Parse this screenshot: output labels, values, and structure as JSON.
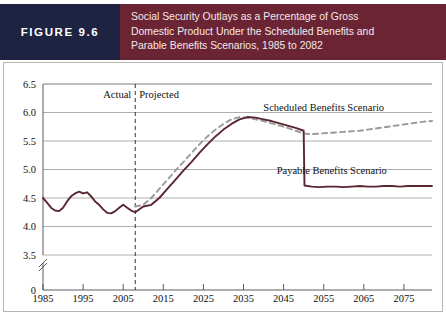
{
  "figure": {
    "label": "FIGURE 9.6",
    "title": "Social Security Outlays as a Percentage of Gross Domestic Product Under the Scheduled Benefits and Parable Benefits Scenarios, 1985 to 2082",
    "title_line1": "Social Security Outlays as a Percentage of Gross",
    "title_line2": "Domestic Product Under the Scheduled Benefits and",
    "title_line3": "Parable Benefits Scenarios, 1985 to 2082",
    "label_bg": "#1e2341",
    "title_bg": "#6b2434"
  },
  "annotations": {
    "actual": "Actual",
    "projected": "Projected",
    "divider_year": 2008
  },
  "chart_data": {
    "type": "line",
    "title": "Social Security Outlays as a Percentage of Gross Domestic Product Under the Scheduled Benefits and Parable Benefits Scenarios, 1985 to 2082",
    "xlabel": "",
    "ylabel": "",
    "xlim": [
      1985,
      2082
    ],
    "ylim": [
      3.5,
      6.5
    ],
    "y_axis_break": true,
    "y_zero_label": "0",
    "grid": true,
    "legend_position": "inline-annotation",
    "yticks": [
      3.5,
      4.0,
      4.5,
      5.0,
      5.5,
      6.0,
      6.5
    ],
    "ytick_labels": [
      "3.5",
      "4.0",
      "4.5",
      "5.0",
      "5.5",
      "6.0",
      "6.5"
    ],
    "xticks": [
      1985,
      1995,
      2005,
      2015,
      2025,
      2035,
      2045,
      2055,
      2065,
      2075
    ],
    "xtick_labels": [
      "1985",
      "1995",
      "2005",
      "2015",
      "2025",
      "2035",
      "2045",
      "2055",
      "2065",
      "2075"
    ],
    "series": [
      {
        "name": "Scheduled Benefits Scenario",
        "style": "dashed",
        "color": "#9a9a9a",
        "x": [
          2008,
          2010,
          2012,
          2014,
          2016,
          2018,
          2020,
          2022,
          2024,
          2026,
          2028,
          2030,
          2032,
          2034,
          2036,
          2038,
          2040,
          2042,
          2044,
          2046,
          2048,
          2050,
          2052,
          2054,
          2056,
          2058,
          2060,
          2062,
          2064,
          2066,
          2068,
          2070,
          2072,
          2074,
          2076,
          2078,
          2080,
          2082
        ],
        "values": [
          4.35,
          4.38,
          4.5,
          4.66,
          4.82,
          4.98,
          5.13,
          5.29,
          5.44,
          5.58,
          5.7,
          5.8,
          5.88,
          5.92,
          5.91,
          5.88,
          5.85,
          5.81,
          5.77,
          5.73,
          5.68,
          5.63,
          5.62,
          5.63,
          5.64,
          5.65,
          5.66,
          5.67,
          5.68,
          5.7,
          5.72,
          5.74,
          5.76,
          5.78,
          5.8,
          5.82,
          5.84,
          5.85
        ]
      },
      {
        "name": "Payable Benefits Scenario",
        "style": "solid",
        "color": "#5a2630",
        "x": [
          1985,
          1986,
          1987,
          1988,
          1989,
          1990,
          1991,
          1992,
          1993,
          1994,
          1995,
          1996,
          1997,
          1998,
          1999,
          2000,
          2001,
          2002,
          2003,
          2004,
          2005,
          2006,
          2007,
          2008,
          2010,
          2012,
          2014,
          2016,
          2018,
          2020,
          2022,
          2024,
          2026,
          2028,
          2030,
          2032,
          2034,
          2036,
          2038,
          2040,
          2042,
          2044,
          2046,
          2048,
          2050,
          2050.2,
          2052,
          2054,
          2056,
          2058,
          2060,
          2062,
          2064,
          2066,
          2068,
          2070,
          2072,
          2074,
          2076,
          2078,
          2080,
          2082
        ],
        "values": [
          4.5,
          4.42,
          4.33,
          4.28,
          4.27,
          4.33,
          4.44,
          4.53,
          4.58,
          4.61,
          4.58,
          4.6,
          4.53,
          4.44,
          4.38,
          4.3,
          4.24,
          4.23,
          4.27,
          4.33,
          4.38,
          4.33,
          4.28,
          4.25,
          4.35,
          4.38,
          4.5,
          4.66,
          4.82,
          4.98,
          5.13,
          5.29,
          5.44,
          5.58,
          5.7,
          5.8,
          5.88,
          5.92,
          5.91,
          5.88,
          5.85,
          5.81,
          5.77,
          5.73,
          5.68,
          4.72,
          4.7,
          4.69,
          4.7,
          4.7,
          4.69,
          4.7,
          4.71,
          4.7,
          4.7,
          4.71,
          4.71,
          4.7,
          4.71,
          4.71,
          4.71,
          4.71
        ]
      }
    ],
    "series_labels": [
      {
        "text": "Scheduled Benefits Scenario",
        "x": 2055,
        "y": 6.02
      },
      {
        "text": "Payable Benefits Scenario",
        "x": 2057,
        "y": 4.92
      }
    ]
  }
}
